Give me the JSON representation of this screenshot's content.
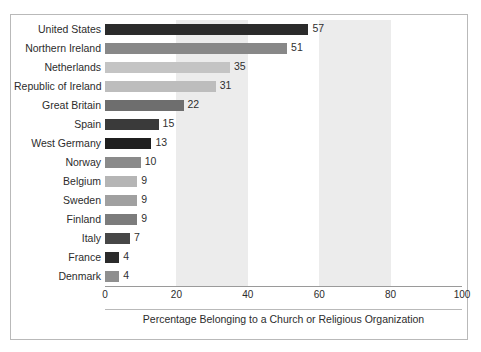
{
  "chart_data": {
    "type": "bar",
    "orientation": "horizontal",
    "title": "",
    "xlabel": "Percentage Belonging to a Church or Religious Organization",
    "ylabel": "",
    "xlim": [
      0,
      100
    ],
    "xticks": [
      0,
      20,
      40,
      60,
      80,
      100
    ],
    "grid": false,
    "legend": "none",
    "band_shading": "alternating vertical bands every 20 units",
    "categories": [
      "United States",
      "Northern Ireland",
      "Netherlands",
      "Republic of Ireland",
      "Great Britain",
      "Spain",
      "West Germany",
      "Norway",
      "Belgium",
      "Sweden",
      "Finland",
      "Italy",
      "France",
      "Denmark"
    ],
    "values": [
      57,
      51,
      35,
      31,
      22,
      15,
      13,
      10,
      9,
      9,
      9,
      7,
      4,
      4
    ],
    "value_labels": [
      "57",
      "51",
      "35",
      "31",
      "22",
      "15",
      "13",
      "10",
      "9",
      "9",
      "9",
      "7",
      "4",
      "4"
    ],
    "bar_colors": [
      "#2b2b2b",
      "#888888",
      "#c4c4c4",
      "#bdbdbd",
      "#6e6e6e",
      "#3a3a3a",
      "#1f1f1f",
      "#8a8a8a",
      "#b5b5b5",
      "#a0a0a0",
      "#7c7c7c",
      "#474747",
      "#2b2b2b",
      "#8f8f8f"
    ]
  },
  "axis": {
    "tick_labels": [
      "0",
      "20",
      "40",
      "60",
      "80",
      "100"
    ],
    "title": "Percentage Belonging to a Church or Religious Organization"
  },
  "colors": {
    "band_shaded": "#ececec",
    "band_plain": "#ffffff",
    "frame": "#b9b9b9",
    "axis_line": "#9a9a9a",
    "text": "#2c2c2c"
  }
}
